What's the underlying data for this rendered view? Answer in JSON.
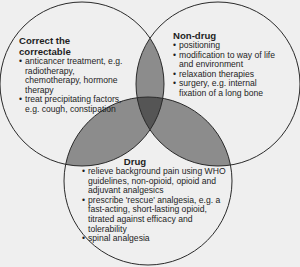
{
  "diagram": {
    "type": "venn-3",
    "colors": {
      "background": "#efefef",
      "outline": "#2a2a2a",
      "pairwise_overlap": "#8c8c8c",
      "triple_overlap": "#555555"
    },
    "sets": [
      {
        "id": "correct",
        "title": "Correct the correctable",
        "items": [
          "anticancer treatment, e.g. radiotherapy, chemotherapy, hormone therapy",
          "treat precipitating factors, e.g. cough, constipation"
        ]
      },
      {
        "id": "nondrug",
        "title": "Non-drug",
        "items": [
          "positioning",
          "modification to way of life and environment",
          "relaxation therapies",
          "surgery, e.g. internal fixation of a long bone"
        ]
      },
      {
        "id": "drug",
        "title": "Drug",
        "items": [
          "relieve background pain using WHO guidelines, non-opioid, opioid and adjuvant analgesics",
          "prescribe 'rescue' analgesia, e.g. a fast-acting, short-lasting opioid, titrated against efficacy and tolerability",
          "spinal analgesia"
        ]
      }
    ]
  }
}
